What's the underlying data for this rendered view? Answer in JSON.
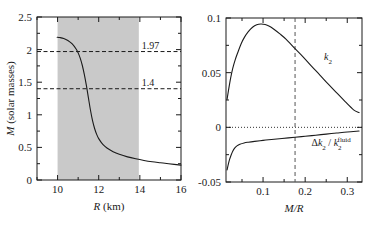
{
  "figure": {
    "width": 371,
    "height": 227,
    "background": "#ffffff",
    "ink": "#1a1a1a",
    "band_color": "#c9c9c9"
  },
  "chart_data": [
    {
      "id": "left-panel",
      "type": "line",
      "title": "",
      "xlabel": "R (km)",
      "xlabel_italic": "R",
      "xlabel_rest": " (km)",
      "ylabel": "M (solar masses)",
      "ylabel_italic": "M",
      "ylabel_rest": " (solar masses)",
      "xlim": [
        9,
        16
      ],
      "ylim": [
        0,
        2.5
      ],
      "grid": false,
      "xticks": [
        10,
        12,
        14,
        16
      ],
      "xtick_labels": [
        "10",
        "12",
        "14",
        "16"
      ],
      "xminor": [
        9,
        11,
        13,
        15
      ],
      "yticks": [
        0,
        0.5,
        1,
        1.5,
        2,
        2.5
      ],
      "ytick_labels": [
        "0",
        "0.5",
        "1",
        "1.5",
        "2",
        "2.5"
      ],
      "yminor": [
        0.25,
        0.75,
        1.25,
        1.75,
        2.25
      ],
      "shaded_band": {
        "x0": 10,
        "x1": 13.95,
        "label": "radius-band"
      },
      "hlines": [
        {
          "value": 1.97,
          "label": "1.97",
          "style": "dashed"
        },
        {
          "value": 1.4,
          "label": "1.4",
          "style": "dashed"
        }
      ],
      "series": [
        {
          "name": "mass-radius",
          "x": [
            9.98,
            10.1,
            10.3,
            10.5,
            10.7,
            10.9,
            11.0,
            11.1,
            11.2,
            11.3,
            11.4,
            11.5,
            11.6,
            11.7,
            11.8,
            11.9,
            12.0,
            12.2,
            12.4,
            12.7,
            13.0,
            13.4,
            13.8,
            14.2,
            14.6,
            15.0,
            15.4,
            16.0
          ],
          "y": [
            2.19,
            2.185,
            2.17,
            2.14,
            2.09,
            2.01,
            1.95,
            1.87,
            1.76,
            1.62,
            1.45,
            1.26,
            1.07,
            0.91,
            0.79,
            0.7,
            0.635,
            0.545,
            0.49,
            0.435,
            0.395,
            0.355,
            0.325,
            0.3,
            0.28,
            0.265,
            0.25,
            0.228
          ]
        }
      ]
    },
    {
      "id": "right-panel",
      "type": "line",
      "title": "",
      "xlabel": "M/R",
      "xlabel_italic": "M/R",
      "ylabel": "",
      "xlim": [
        0.012,
        0.335
      ],
      "ylim": [
        -0.05,
        0.1
      ],
      "grid": false,
      "xticks": [
        0.1,
        0.2,
        0.3
      ],
      "xtick_labels": [
        "0.1",
        "0.2",
        "0.3"
      ],
      "xminor": [
        0.05,
        0.15,
        0.25
      ],
      "yticks": [
        -0.05,
        0,
        0.05,
        0.1
      ],
      "ytick_labels": [
        "-0.05",
        "0",
        "0.05",
        "0.1"
      ],
      "yminor": [
        -0.025,
        0.025,
        0.075
      ],
      "zero_line": {
        "value": 0,
        "style": "dotted"
      },
      "vline": {
        "value": 0.176,
        "style": "dashed"
      },
      "series": [
        {
          "name": "k2",
          "label": "k₂",
          "label_base": "k",
          "label_sub": "2",
          "label_x": 0.245,
          "label_y": 0.062,
          "x": [
            0.0145,
            0.018,
            0.023,
            0.028,
            0.034,
            0.04,
            0.048,
            0.056,
            0.065,
            0.075,
            0.085,
            0.095,
            0.105,
            0.115,
            0.125,
            0.14,
            0.155,
            0.176,
            0.195,
            0.215,
            0.235,
            0.255,
            0.275,
            0.295,
            0.315,
            0.328
          ],
          "y": [
            0.0255,
            0.034,
            0.045,
            0.054,
            0.062,
            0.0685,
            0.0765,
            0.0825,
            0.0875,
            0.0915,
            0.0938,
            0.0945,
            0.094,
            0.0925,
            0.09,
            0.0855,
            0.0805,
            0.072,
            0.0645,
            0.056,
            0.0478,
            0.0395,
            0.0315,
            0.0235,
            0.016,
            0.0135
          ]
        },
        {
          "name": "delta-k2-over-k2-fluid",
          "label": "Δk₂ / k₂fluid",
          "label_delta": "Δ",
          "label_k": "k",
          "label_sub": "2",
          "label_slash": " / ",
          "label_k2": "k",
          "label_sup": "fluid",
          "label_x": 0.215,
          "label_y": -0.0175,
          "x": [
            0.0145,
            0.017,
            0.02,
            0.024,
            0.028,
            0.033,
            0.038,
            0.045,
            0.055,
            0.065,
            0.08,
            0.1,
            0.12,
            0.145,
            0.176,
            0.2,
            0.225,
            0.25,
            0.275,
            0.3,
            0.328
          ],
          "y": [
            -0.039,
            -0.0345,
            -0.03,
            -0.0255,
            -0.0218,
            -0.0188,
            -0.017,
            -0.0155,
            -0.0143,
            -0.0136,
            -0.0128,
            -0.0119,
            -0.0111,
            -0.0102,
            -0.0091,
            -0.0082,
            -0.0072,
            -0.0062,
            -0.0052,
            -0.0042,
            -0.0034
          ]
        }
      ]
    }
  ]
}
